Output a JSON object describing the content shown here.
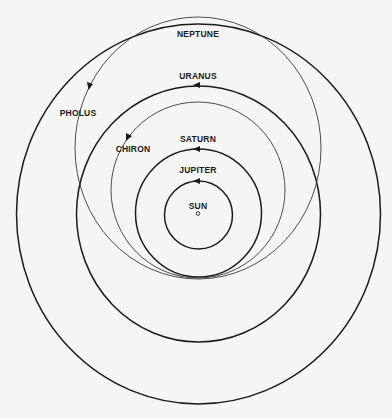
{
  "diagram": {
    "center": {
      "x": 198,
      "y": 214
    },
    "bodies": [
      {
        "id": "sun",
        "label": "SUN",
        "type": "star"
      },
      {
        "id": "jupiter",
        "label": "JUPITER",
        "type": "planet",
        "orbit": "circle"
      },
      {
        "id": "saturn",
        "label": "SATURN",
        "type": "planet",
        "orbit": "circle"
      },
      {
        "id": "uranus",
        "label": "URANUS",
        "type": "planet",
        "orbit": "circle"
      },
      {
        "id": "neptune",
        "label": "NEPTUNE",
        "type": "planet",
        "orbit": "circle"
      },
      {
        "id": "chiron",
        "label": "CHIRON",
        "type": "centaur",
        "orbit": "eccentric"
      },
      {
        "id": "pholus",
        "label": "PHOLUS",
        "type": "centaur",
        "orbit": "eccentric"
      }
    ],
    "labels": {
      "sun": "SUN",
      "jupiter": "JUPITER",
      "saturn": "SATURN",
      "uranus": "URANUS",
      "neptune": "NEPTUNE",
      "chiron": "CHIRON",
      "pholus": "PHOLUS"
    },
    "colors": {
      "line": "#1c1c1c",
      "background": "#f5f5f3"
    }
  }
}
